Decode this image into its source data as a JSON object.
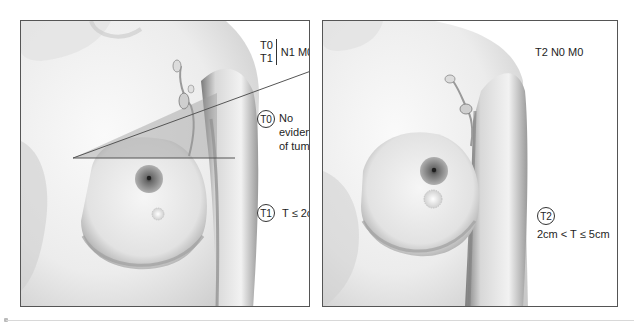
{
  "figure": {
    "topic": "Breast cancer TNM staging",
    "panels": [
      {
        "id": "left",
        "stage_header": {
          "t_options": [
            "T0",
            "T1"
          ],
          "rest": "N1 M0"
        },
        "annotations": [
          {
            "badge": "T0",
            "text_lines": [
              "No",
              "evidence",
              "of tumor"
            ]
          },
          {
            "badge": "T1",
            "text": "T ≤ 2cm"
          }
        ],
        "overlay": "triangular shaded region from sternum to axilla indicating lymph node involvement"
      },
      {
        "id": "right",
        "stage_header": {
          "text": "T2 N0 M0"
        },
        "annotations": [
          {
            "badge": "T2",
            "text": "2cm < T ≤ 5cm"
          }
        ]
      }
    ]
  },
  "colors": {
    "frame": "#555555",
    "skin_light": "#f4f4f4",
    "skin_shadow": "#9a9a9a",
    "areola": "#6e6e6e",
    "overlay_fill": "#9c9c9c",
    "text": "#1e1e1e",
    "footer_line": "#d8d8d8"
  }
}
